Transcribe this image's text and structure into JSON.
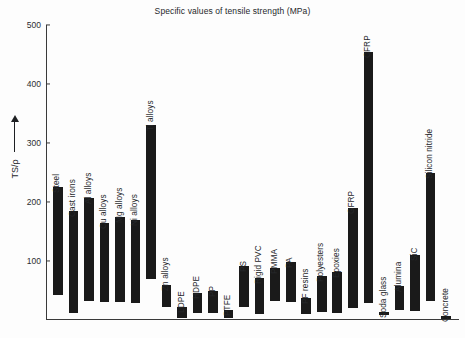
{
  "chart_data": {
    "type": "bar",
    "title": "Specific values of tensile strength (MPa)",
    "xlabel": "",
    "ylabel": "TS/ρ",
    "ylim": [
      0,
      500
    ],
    "yticks": [
      100,
      200,
      300,
      400,
      500
    ],
    "grid": false,
    "legend": null,
    "note": "Floating bars: each material spans a range from low to high specific tensile strength.",
    "categories": [
      "Steel",
      "Cast irons",
      "Al alloys",
      "Cu alloys",
      "Mg alloys",
      "Ni alloys",
      "Ti alloys",
      "Zn alloys",
      "LDPE",
      "HDPE",
      "PP",
      "PTFE",
      "PS",
      "Rigid PVC",
      "PMMA",
      "PA",
      "PF resins",
      "Polyesters",
      "Epoxies",
      "GFRP",
      "CFRP",
      "Soda glass",
      "Alumina",
      "SiC",
      "Silicon nitride",
      "Concrete"
    ],
    "low_values": [
      43,
      12,
      33,
      30,
      30,
      28,
      70,
      22,
      4,
      11,
      12,
      3,
      22,
      10,
      32,
      30,
      10,
      14,
      12,
      20,
      28,
      8,
      17,
      15,
      33,
      2
    ],
    "high_values": [
      225,
      185,
      207,
      165,
      175,
      170,
      330,
      60,
      22,
      45,
      50,
      17,
      92,
      72,
      88,
      98,
      38,
      75,
      82,
      190,
      455,
      13,
      58,
      110,
      250,
      6
    ]
  },
  "axis": {
    "y_label": "TS/ρ"
  }
}
